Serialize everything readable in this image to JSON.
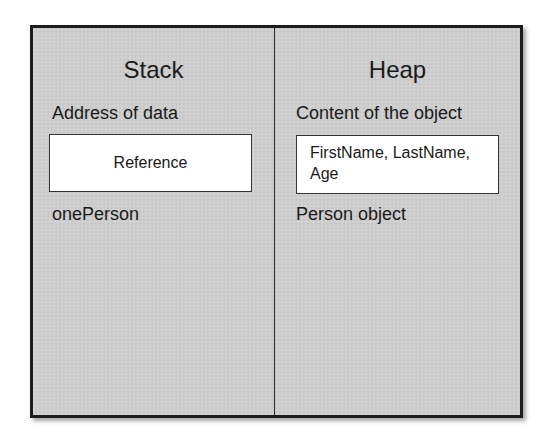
{
  "diagram": {
    "stack": {
      "heading": "Stack",
      "caption_top": "Address of data",
      "box_text": "Reference",
      "caption_bottom": "onePerson"
    },
    "heap": {
      "heading": "Heap",
      "caption_top": "Content of the object",
      "box_line1": "FirstName, LastName,",
      "box_line2": "Age",
      "caption_bottom": "Person object"
    },
    "colors": {
      "panel_fill": "#cfcfcf",
      "border": "#1c1c1c",
      "box_fill": "#ffffff",
      "text": "#1a1a1a"
    }
  }
}
